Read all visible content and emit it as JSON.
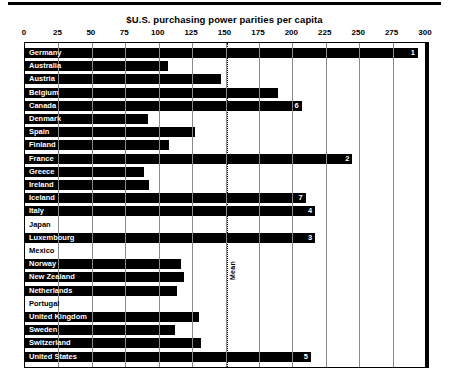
{
  "chart_data": {
    "type": "bar",
    "orientation": "horizontal",
    "title": "$U.S. purchasing power parities per capita",
    "xlabel": "",
    "ylabel": "",
    "xlim": [
      0,
      300
    ],
    "xticks": [
      0,
      25,
      50,
      75,
      100,
      125,
      150,
      175,
      200,
      225,
      250,
      275,
      300
    ],
    "grid": true,
    "legend": null,
    "annotations": [
      {
        "label": "Mean",
        "type": "vertical-dotted-line",
        "value": 151
      }
    ],
    "categories": [
      "Germany",
      "Australia",
      "Austria",
      "Belgium",
      "Canada",
      "Denmark",
      "Spain",
      "Finland",
      "France",
      "Greece",
      "Ireland",
      "Iceland",
      "Italy",
      "Japan",
      "Luxembourg",
      "Mexico",
      "Norway",
      "New Zealand",
      "Netherlands",
      "Portugal",
      "United Kingdom",
      "Sweden",
      "Switzerland",
      "United States"
    ],
    "values": [
      294,
      107,
      147,
      189,
      207,
      92,
      127,
      108,
      245,
      89,
      93,
      210,
      217,
      0,
      217,
      0,
      117,
      119,
      114,
      0,
      130,
      112,
      132,
      214
    ],
    "rank_labels": {
      "Germany": "1",
      "France": "2",
      "Luxembourg": "3",
      "Italy": "4",
      "United States": "5",
      "Canada": "6",
      "Iceland": "7"
    }
  }
}
